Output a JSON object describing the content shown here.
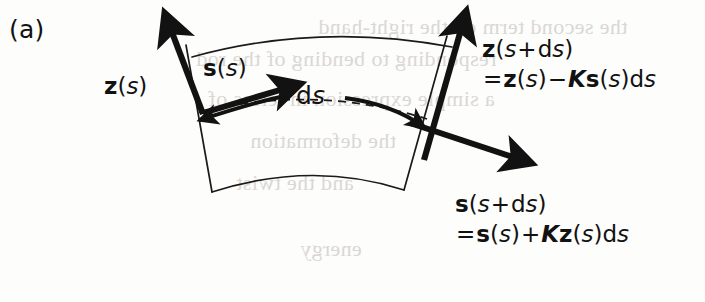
{
  "figure": {
    "panel_id": "(a)",
    "background_color": "#fdfdfc",
    "ink_color": "#121212",
    "thin_line_color": "#1a1a1a"
  },
  "labels": {
    "z_at_s": {
      "vector": "z",
      "arg_open": "(",
      "arg": "s",
      "arg_close": ")"
    },
    "s_at_s": {
      "vector": "s",
      "arg_open": "(",
      "arg": "s",
      "arg_close": ")"
    },
    "arc_length": {
      "d": "d",
      "s": "s"
    },
    "z_at_s_plus_ds": {
      "line1": {
        "vector": "z",
        "arg_open": "(",
        "arg": "s",
        "plus": "+",
        "d": "d",
        "ds_s": "s",
        "arg_close": ")"
      },
      "line2": {
        "equals": "=",
        "vector": "z",
        "arg_open": "(",
        "arg": "s",
        "arg_close": ")",
        "minus": "−",
        "constant": "K",
        "vector2": "s",
        "arg2_open": "(",
        "arg2": "s",
        "arg2_close": ")",
        "d": "d",
        "trail_s": "s"
      }
    },
    "s_at_s_plus_ds": {
      "line1": {
        "vector": "s",
        "arg_open": "(",
        "arg": "s",
        "plus": "+",
        "d": "d",
        "ds_s": "s",
        "arg_close": ")"
      },
      "line2": {
        "equals": "=",
        "vector": "s",
        "arg_open": "(",
        "arg": "s",
        "arg_close": ")",
        "plus": "+",
        "constant": "K",
        "vector2": "z",
        "arg2_open": "(",
        "arg2": "s",
        "arg2_close": ")",
        "d": "d",
        "trail_s": "s"
      }
    }
  },
  "bleed_through": {
    "note": "faint mirrored show-through text from the reverse side of the printed page",
    "lines": [
      {
        "text": "the second term on the right-hand",
        "x": 318,
        "y": 14
      },
      {
        "text": "responding to bending of the rod",
        "x": 196,
        "y": 46
      },
      {
        "text": "a simple expression in terms of",
        "x": 208,
        "y": 86
      },
      {
        "text": "the deformation",
        "x": 250,
        "y": 128
      },
      {
        "text": "and the twist",
        "x": 236,
        "y": 170
      },
      {
        "text": "energy",
        "x": 300,
        "y": 236
      }
    ]
  }
}
